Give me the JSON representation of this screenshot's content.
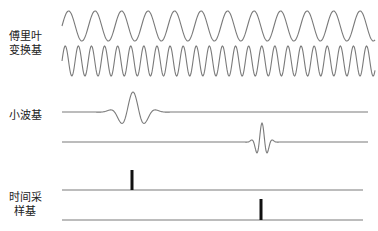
{
  "labels": {
    "fourier": [
      "傅里叶",
      "变换基"
    ],
    "wavelet": "小波基",
    "time": [
      "时间采",
      "样基"
    ]
  },
  "colors": {
    "curve": "#7a7a7a",
    "spike": "#111111",
    "text": "#222222"
  },
  "fourier": {
    "x_start": 62,
    "x_end": 375,
    "rows": [
      {
        "center_y": 26,
        "amplitude": 15,
        "period": 26.5
      },
      {
        "center_y": 61,
        "amplitude": 15,
        "period": 13.1
      }
    ]
  },
  "wavelets": [
    {
      "baseline_y": 112,
      "center_x": 133,
      "amplitude": 20,
      "scale": 11,
      "x_start": 62,
      "x_end": 368
    },
    {
      "baseline_y": 142,
      "center_x": 262,
      "amplitude": 19,
      "scale": 5,
      "x_start": 62,
      "x_end": 368
    }
  ],
  "spikes": [
    {
      "baseline_y": 190,
      "x": 132,
      "top_y": 170,
      "x_start": 62,
      "x_end": 363
    },
    {
      "baseline_y": 220,
      "x": 261,
      "top_y": 199,
      "x_start": 62,
      "x_end": 363
    }
  ]
}
